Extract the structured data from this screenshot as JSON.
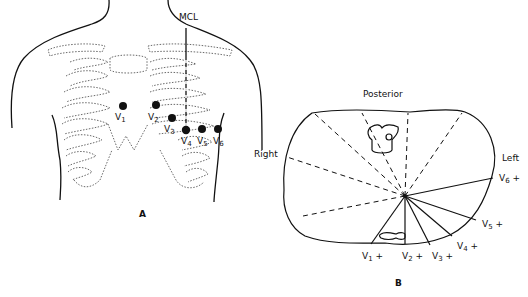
{
  "figure_a": {
    "caption": "A",
    "mcl_label": "MCL",
    "electrodes": [
      {
        "lead": "V",
        "sub": "1",
        "x": 123,
        "y": 106
      },
      {
        "lead": "V",
        "sub": "2",
        "x": 156,
        "y": 105
      },
      {
        "lead": "V",
        "sub": "3",
        "x": 172,
        "y": 118
      },
      {
        "lead": "V",
        "sub": "4",
        "x": 186,
        "y": 130
      },
      {
        "lead": "V",
        "sub": "5",
        "x": 202,
        "y": 129
      },
      {
        "lead": "V",
        "sub": "6",
        "x": 218,
        "y": 129
      }
    ]
  },
  "figure_b": {
    "caption": "B",
    "posterior_label": "Posterior",
    "right_label": "Right",
    "left_label": "Left",
    "leads": [
      {
        "lead": "V",
        "sub": "1",
        "sign": "+"
      },
      {
        "lead": "V",
        "sub": "2",
        "sign": "+"
      },
      {
        "lead": "V",
        "sub": "3",
        "sign": "+"
      },
      {
        "lead": "V",
        "sub": "4",
        "sign": "+"
      },
      {
        "lead": "V",
        "sub": "5",
        "sign": "+"
      },
      {
        "lead": "V",
        "sub": "6",
        "sign": "+"
      }
    ]
  }
}
